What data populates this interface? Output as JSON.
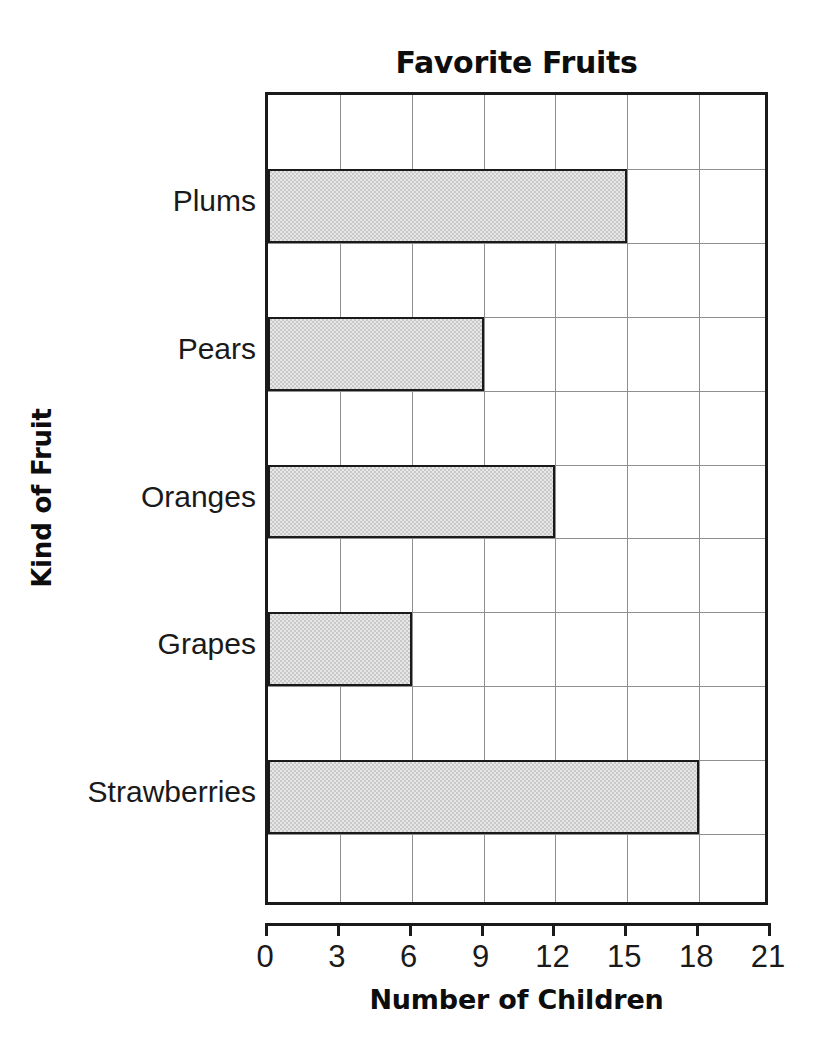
{
  "chart_data": {
    "type": "bar",
    "orientation": "horizontal",
    "title": "Favorite Fruits",
    "xlabel": "Number of Children",
    "ylabel": "Kind of Fruit",
    "categories": [
      "Plums",
      "Pears",
      "Oranges",
      "Grapes",
      "Strawberries"
    ],
    "values": [
      15,
      9,
      12,
      6,
      18
    ],
    "xticks": [
      0,
      3,
      6,
      9,
      12,
      15,
      18,
      21
    ],
    "xtick_labels": [
      "0",
      "3",
      "6",
      "9",
      "12",
      "15",
      "18",
      "21"
    ],
    "xlim": [
      0,
      21
    ],
    "grid": true,
    "legend": null,
    "bar_fill_color": "#c9c9c9",
    "bar_edge_color": "#1a1a1a",
    "gridline_color": "#8f8f8f",
    "axis_color": "#1a1a1a",
    "background_color": "#ffffff"
  }
}
